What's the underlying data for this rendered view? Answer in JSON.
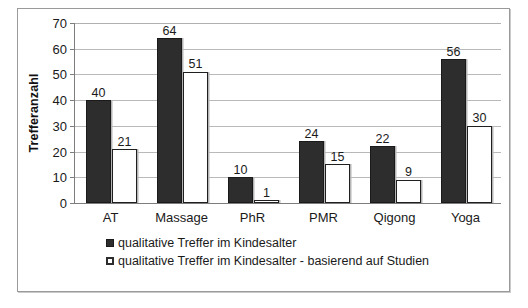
{
  "chart_data": {
    "type": "bar",
    "title": "",
    "xlabel": "",
    "ylabel": "Trefferanzahl",
    "ylim": [
      0,
      70
    ],
    "ytick_step": 10,
    "yticks": [
      0,
      10,
      20,
      30,
      40,
      50,
      60,
      70
    ],
    "grid": true,
    "legend_position": "bottom-left",
    "categories": [
      "AT",
      "Massage",
      "PhR",
      "PMR",
      "Qigong",
      "Yoga"
    ],
    "series": [
      {
        "name": "qualitative Treffer im Kindesalter",
        "color": "#2d2d2d",
        "values": [
          40,
          64,
          10,
          24,
          22,
          56
        ]
      },
      {
        "name": "qualitative Treffer im Kindesalter - basierend auf Studien",
        "color": "#ffffff",
        "values": [
          21,
          51,
          1,
          15,
          9,
          30
        ]
      }
    ]
  },
  "legend": {
    "entries": [
      "qualitative Treffer im Kindesalter",
      "qualitative Treffer im Kindesalter - basierend auf Studien"
    ]
  }
}
